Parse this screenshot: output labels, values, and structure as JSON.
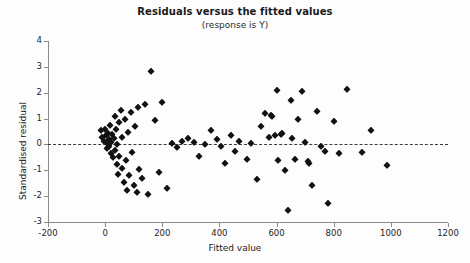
{
  "chart_data": {
    "type": "scatter",
    "title": "Residuals versus the fitted values",
    "subtitle": "(response is Y)",
    "xlabel": "Fitted value",
    "ylabel": "Standardised residual",
    "xlim": [
      -200,
      1200
    ],
    "ylim": [
      -3,
      4
    ],
    "xticks": [
      -200,
      0,
      200,
      400,
      600,
      800,
      1000,
      1200
    ],
    "yticks": [
      -3,
      -2,
      -1,
      0,
      1,
      2,
      3,
      4
    ],
    "xticklabels": [
      "-200",
      "0",
      "200",
      "400",
      "600",
      "800",
      "1000",
      "1200"
    ],
    "yticklabels": [
      "-3",
      "-2",
      "-1",
      "0",
      "1",
      "2",
      "3",
      "4"
    ],
    "grid": false,
    "legend": null,
    "reference_line": {
      "type": "horizontal",
      "y": 0,
      "style": "dashed"
    },
    "marker": "diamond",
    "marker_color": "#121212",
    "points": [
      {
        "x": -15,
        "y": 0.55
      },
      {
        "x": -10,
        "y": 0.3
      },
      {
        "x": -5,
        "y": 0.15
      },
      {
        "x": 0,
        "y": 0.6
      },
      {
        "x": 2,
        "y": 0.35
      },
      {
        "x": 5,
        "y": 0.05
      },
      {
        "x": 8,
        "y": -0.15
      },
      {
        "x": 10,
        "y": 0.45
      },
      {
        "x": 12,
        "y": 0.2
      },
      {
        "x": 15,
        "y": -0.05
      },
      {
        "x": 18,
        "y": 0.75
      },
      {
        "x": 20,
        "y": 0.1
      },
      {
        "x": 22,
        "y": -0.35
      },
      {
        "x": 25,
        "y": 0.4
      },
      {
        "x": 28,
        "y": -0.5
      },
      {
        "x": 30,
        "y": 0.25
      },
      {
        "x": 33,
        "y": 1.1
      },
      {
        "x": 35,
        "y": -0.2
      },
      {
        "x": 38,
        "y": 0.6
      },
      {
        "x": 40,
        "y": -0.75
      },
      {
        "x": 42,
        "y": 0.0
      },
      {
        "x": 45,
        "y": -1.15
      },
      {
        "x": 48,
        "y": 0.85
      },
      {
        "x": 50,
        "y": -0.45
      },
      {
        "x": 55,
        "y": 1.35
      },
      {
        "x": 58,
        "y": -0.9
      },
      {
        "x": 60,
        "y": 0.3
      },
      {
        "x": 65,
        "y": -1.45
      },
      {
        "x": 70,
        "y": 1.0
      },
      {
        "x": 72,
        "y": -0.6
      },
      {
        "x": 75,
        "y": -1.75
      },
      {
        "x": 80,
        "y": 0.5
      },
      {
        "x": 85,
        "y": -1.2
      },
      {
        "x": 90,
        "y": 1.25
      },
      {
        "x": 95,
        "y": -0.3
      },
      {
        "x": 100,
        "y": -1.55
      },
      {
        "x": 105,
        "y": 0.7
      },
      {
        "x": 110,
        "y": -1.85
      },
      {
        "x": 115,
        "y": 1.45
      },
      {
        "x": 120,
        "y": -0.95
      },
      {
        "x": 130,
        "y": -1.3
      },
      {
        "x": 140,
        "y": 1.55
      },
      {
        "x": 150,
        "y": -1.9
      },
      {
        "x": 160,
        "y": 2.85
      },
      {
        "x": 175,
        "y": 0.95
      },
      {
        "x": 190,
        "y": -1.05
      },
      {
        "x": 200,
        "y": 1.65
      },
      {
        "x": 215,
        "y": -1.7
      },
      {
        "x": 235,
        "y": 0.05
      },
      {
        "x": 250,
        "y": -0.1
      },
      {
        "x": 270,
        "y": 0.15
      },
      {
        "x": 290,
        "y": 0.25
      },
      {
        "x": 310,
        "y": 0.1
      },
      {
        "x": 330,
        "y": -0.45
      },
      {
        "x": 350,
        "y": 0.0
      },
      {
        "x": 370,
        "y": 0.55
      },
      {
        "x": 390,
        "y": 0.2
      },
      {
        "x": 405,
        "y": -0.05
      },
      {
        "x": 420,
        "y": -0.7
      },
      {
        "x": 440,
        "y": 0.35
      },
      {
        "x": 455,
        "y": -0.25
      },
      {
        "x": 470,
        "y": 0.15
      },
      {
        "x": 495,
        "y": -0.55
      },
      {
        "x": 510,
        "y": 0.05
      },
      {
        "x": 530,
        "y": -1.35
      },
      {
        "x": 545,
        "y": 0.7
      },
      {
        "x": 560,
        "y": 1.2
      },
      {
        "x": 575,
        "y": 0.3
      },
      {
        "x": 580,
        "y": 1.15
      },
      {
        "x": 585,
        "y": 1.1
      },
      {
        "x": 595,
        "y": 0.35
      },
      {
        "x": 600,
        "y": 2.1
      },
      {
        "x": 605,
        "y": -0.6
      },
      {
        "x": 615,
        "y": 0.4
      },
      {
        "x": 620,
        "y": 0.45
      },
      {
        "x": 630,
        "y": -1.0
      },
      {
        "x": 640,
        "y": -2.55
      },
      {
        "x": 650,
        "y": 1.7
      },
      {
        "x": 655,
        "y": 0.25
      },
      {
        "x": 665,
        "y": -0.55
      },
      {
        "x": 675,
        "y": 1.0
      },
      {
        "x": 690,
        "y": 2.05
      },
      {
        "x": 700,
        "y": 0.1
      },
      {
        "x": 710,
        "y": -0.65
      },
      {
        "x": 715,
        "y": -0.7
      },
      {
        "x": 725,
        "y": -1.55
      },
      {
        "x": 740,
        "y": 1.3
      },
      {
        "x": 755,
        "y": -0.05
      },
      {
        "x": 770,
        "y": -0.25
      },
      {
        "x": 780,
        "y": -2.25
      },
      {
        "x": 800,
        "y": 0.9
      },
      {
        "x": 820,
        "y": -0.35
      },
      {
        "x": 845,
        "y": 2.15
      },
      {
        "x": 900,
        "y": -0.3
      },
      {
        "x": 930,
        "y": 0.55
      },
      {
        "x": 985,
        "y": -0.8
      }
    ]
  }
}
